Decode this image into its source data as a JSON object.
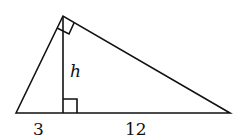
{
  "figure": {
    "type": "right-triangle-altitude",
    "labels": {
      "height": "h",
      "left_segment": "3",
      "right_segment": "12"
    },
    "line_color": "#111111",
    "background": "#ffffff"
  }
}
